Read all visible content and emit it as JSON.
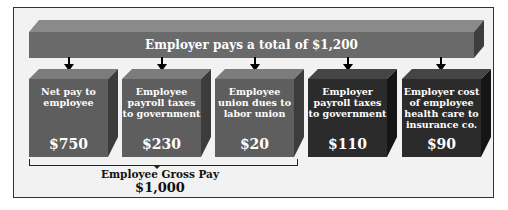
{
  "header": {
    "label": "Employer pays a total of $1,200"
  },
  "boxes": [
    {
      "description": "Net pay to employee",
      "amount": "$750",
      "shade": "light"
    },
    {
      "description": "Employee payroll taxes to government",
      "amount": "$230",
      "shade": "light"
    },
    {
      "description": "Employee union dues to labor union",
      "amount": "$20",
      "shade": "light"
    },
    {
      "description": "Employer payroll taxes to government",
      "amount": "$110",
      "shade": "dark"
    },
    {
      "description": "Employer cost of employee health care to insurance co.",
      "amount": "$90",
      "shade": "dark"
    }
  ],
  "gross": {
    "label": "Employee Gross Pay",
    "amount": "$1,000"
  },
  "colors": {
    "bar_front": "#6a6a6a",
    "employee_box": "#5e5e5e",
    "employer_box": "#2b2b2b",
    "background": "#f2f2f2"
  }
}
